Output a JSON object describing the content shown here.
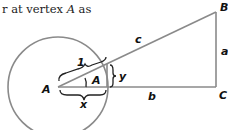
{
  "caption": {
    "prefix": "r at vertex ",
    "vertex": "A",
    "suffix": " as"
  },
  "diagram": {
    "labels": {
      "vertex_A_outer": "A",
      "angle_A": "A",
      "vertex_B": "B",
      "vertex_C": "C",
      "side_a": "a",
      "side_b": "b",
      "side_c": "c",
      "unit_radius": "1",
      "x_segment": "x",
      "y_segment": "y"
    },
    "colors": {
      "stroke": "#8a8a8a",
      "text": "#111111"
    }
  }
}
